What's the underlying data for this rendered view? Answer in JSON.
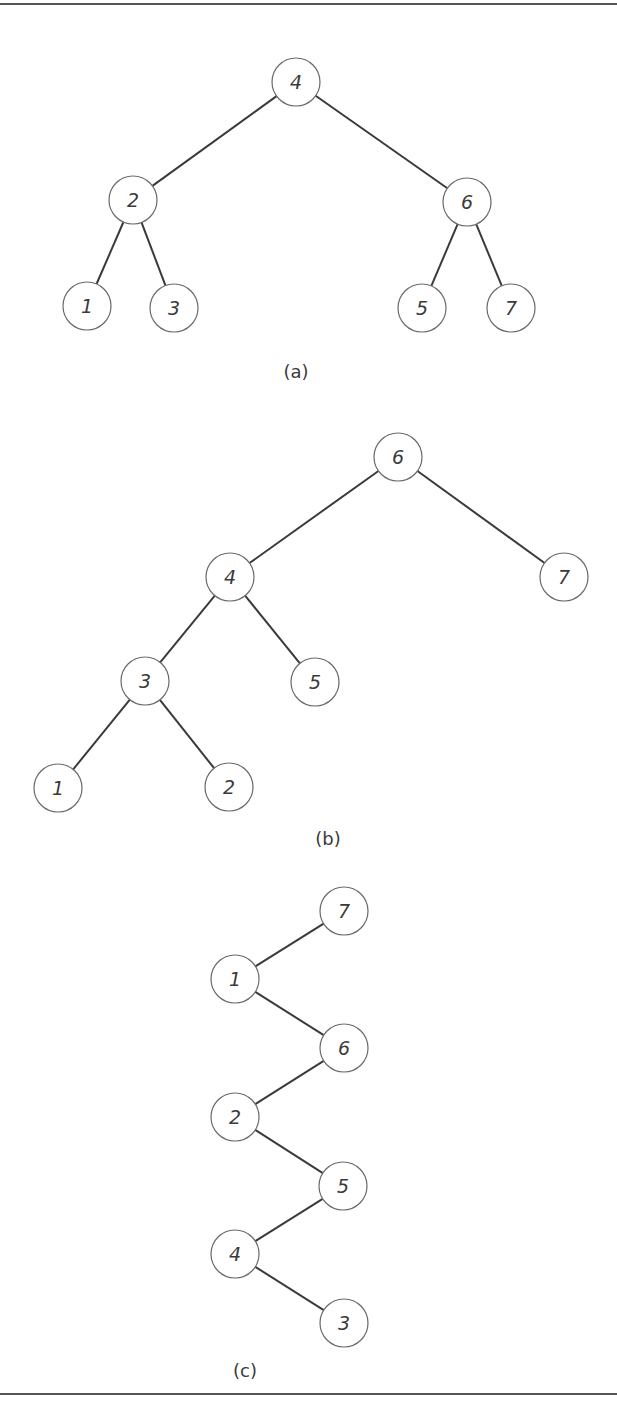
{
  "node_radius": 24,
  "rules": [
    {
      "x1": 0,
      "y1": 4,
      "x2": 617,
      "y2": 4
    },
    {
      "x1": 0,
      "y1": 1394,
      "x2": 617,
      "y2": 1394
    }
  ],
  "trees": [
    {
      "id": "a",
      "caption": "(a)",
      "caption_pos": {
        "x": 296,
        "y": 371
      },
      "nodes": [
        {
          "label": "4",
          "x": 296,
          "y": 82
        },
        {
          "label": "2",
          "x": 133,
          "y": 200
        },
        {
          "label": "6",
          "x": 467,
          "y": 202
        },
        {
          "label": "1",
          "x": 87,
          "y": 306
        },
        {
          "label": "3",
          "x": 174,
          "y": 308
        },
        {
          "label": "5",
          "x": 422,
          "y": 308
        },
        {
          "label": "7",
          "x": 511,
          "y": 308
        }
      ],
      "edges": [
        [
          "4",
          "2"
        ],
        [
          "4",
          "6"
        ],
        [
          "2",
          "1"
        ],
        [
          "2",
          "3"
        ],
        [
          "6",
          "5"
        ],
        [
          "6",
          "7"
        ]
      ]
    },
    {
      "id": "b",
      "caption": "(b)",
      "caption_pos": {
        "x": 328,
        "y": 838
      },
      "nodes": [
        {
          "label": "6",
          "x": 398,
          "y": 457
        },
        {
          "label": "4",
          "x": 230,
          "y": 577
        },
        {
          "label": "7",
          "x": 564,
          "y": 577
        },
        {
          "label": "3",
          "x": 145,
          "y": 681
        },
        {
          "label": "5",
          "x": 315,
          "y": 682
        },
        {
          "label": "1",
          "x": 58,
          "y": 788
        },
        {
          "label": "2",
          "x": 229,
          "y": 787
        }
      ],
      "edges": [
        [
          "6",
          "4"
        ],
        [
          "6",
          "7"
        ],
        [
          "4",
          "3"
        ],
        [
          "4",
          "5"
        ],
        [
          "3",
          "1"
        ],
        [
          "3",
          "2"
        ]
      ]
    },
    {
      "id": "c",
      "caption": "(c)",
      "caption_pos": {
        "x": 245,
        "y": 1370
      },
      "nodes": [
        {
          "label": "7",
          "x": 344,
          "y": 911
        },
        {
          "label": "1",
          "x": 235,
          "y": 979
        },
        {
          "label": "6",
          "x": 344,
          "y": 1048
        },
        {
          "label": "2",
          "x": 235,
          "y": 1117
        },
        {
          "label": "5",
          "x": 343,
          "y": 1186
        },
        {
          "label": "4",
          "x": 235,
          "y": 1254
        },
        {
          "label": "3",
          "x": 344,
          "y": 1323
        }
      ],
      "edges": [
        [
          "7",
          "1"
        ],
        [
          "1",
          "6"
        ],
        [
          "6",
          "2"
        ],
        [
          "2",
          "5"
        ],
        [
          "5",
          "4"
        ],
        [
          "4",
          "3"
        ]
      ]
    }
  ]
}
